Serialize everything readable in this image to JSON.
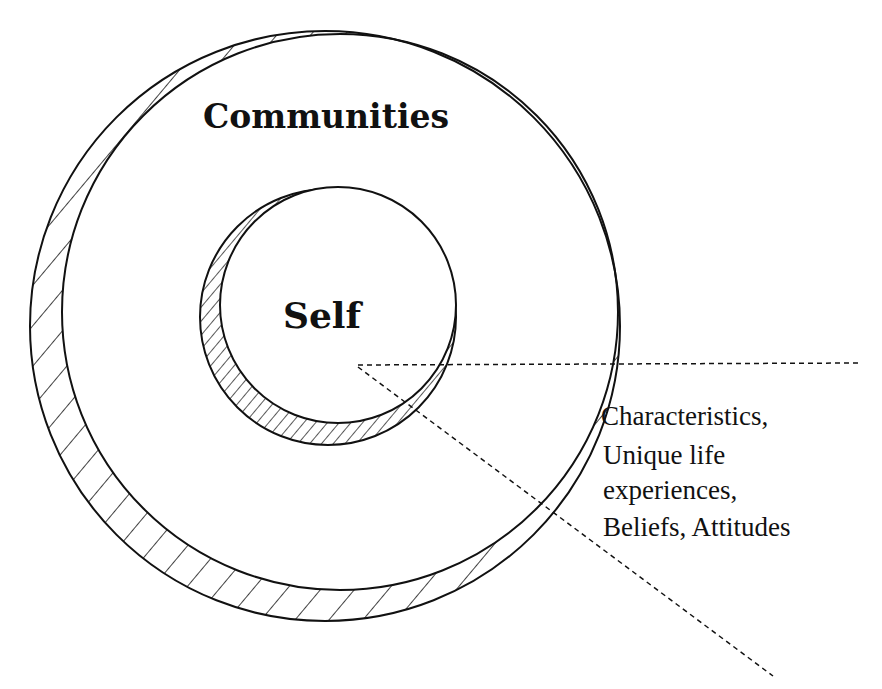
{
  "diagram": {
    "type": "nested-circles",
    "outer_label": "Communities",
    "inner_label": "Self",
    "annotation_lines": [
      "Characteristics,",
      "Unique life",
      "experiences,",
      "Beliefs, Attitudes"
    ],
    "colors": {
      "stroke": "#111111",
      "background": "#ffffff"
    }
  }
}
